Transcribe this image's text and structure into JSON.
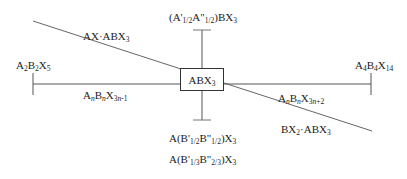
{
  "diagram": {
    "type": "phase-diagram-schematic",
    "center": {
      "formula": "ABX",
      "sub": "3"
    },
    "labels": {
      "top": "(A'1/2A\"1/2)BX3",
      "upper_left_diagonal": "AX·ABX3",
      "left_end": "A2B2X5",
      "left_series": "AnBnX3n-1",
      "right_end": "A4B4X14",
      "right_series": "AnBnX3n+2",
      "lower_right_diagonal": "BX2·ABX3",
      "bottom_1": "A(B'1/2B\"1/2)X3",
      "bottom_2": "A(B'1/3B\"2/3)X3"
    },
    "colors": {
      "line": "#555555",
      "text": "#222222",
      "box_border": "#333333"
    }
  }
}
